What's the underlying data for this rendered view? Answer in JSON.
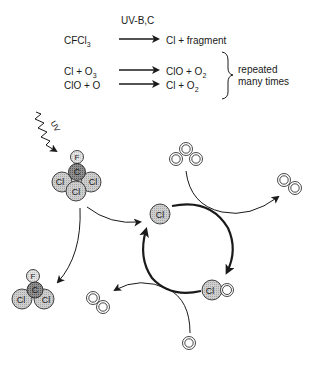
{
  "equations": {
    "catalyst_label": "UV-B,C",
    "rows": [
      {
        "reactants": "CFCl",
        "reactants_sub": "3",
        "reactants_tail": "",
        "products": "Cl  + fragment",
        "products_sub": "",
        "products_tail": ""
      },
      {
        "reactants": "Cl + O",
        "reactants_sub": "3",
        "reactants_tail": "",
        "products": "ClO + O",
        "products_sub": "2",
        "products_tail": ""
      },
      {
        "reactants": "ClO + O",
        "reactants_sub": "",
        "reactants_tail": "",
        "products": "Cl + O",
        "products_sub": "2",
        "products_tail": ""
      }
    ],
    "brace_note_line1": "repeated",
    "brace_note_line2": "many times"
  },
  "diagram": {
    "uv_label": "UV",
    "cfcl3": {
      "f": "F",
      "c": "C",
      "cl": "Cl"
    },
    "cfcl2": {
      "f": "F",
      "c": "C",
      "cl": "Cl"
    },
    "cycle": {
      "cl": "Cl",
      "clo_cl": "Cl",
      "o": "O"
    },
    "ozone_label": "O",
    "oxygen_label": "O",
    "atomic_oxygen": "O"
  },
  "colors": {
    "chlorine_fill": "#c8c8c8",
    "carbon_fill": "#8a8a8a",
    "fluorine_fill": "#dcdcdc",
    "oxygen_fill": "#ffffff",
    "stroke": "#1a1a1a"
  }
}
